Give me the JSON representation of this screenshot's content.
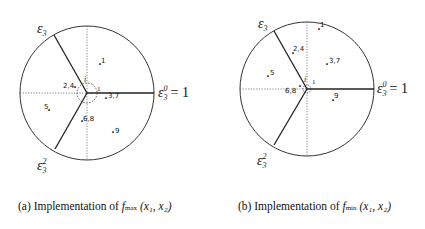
{
  "panels": [
    {
      "id": "a",
      "center": [
        87,
        93
      ],
      "radius": 67,
      "labels": {
        "top_axis": "ε3",
        "right_axis": "ε3^0 = 1",
        "bottom_axis": "ε3^2",
        "origin_i": "i",
        "origin_1": "1"
      },
      "points": [
        {
          "label": "1",
          "x": 100,
          "y": 69
        },
        {
          "label": "2,4",
          "x": 75,
          "y": 92
        },
        {
          "label": "3,7",
          "x": 106,
          "y": 103
        },
        {
          "label": "5",
          "x": 49,
          "y": 115
        },
        {
          "label": "6,8",
          "x": 82,
          "y": 126
        },
        {
          "label": "9",
          "x": 113,
          "y": 137
        }
      ],
      "caption": {
        "prefix": "(a) Implementation of ",
        "func": "f",
        "sub": "max",
        "args": "(x₁, x₂)"
      }
    },
    {
      "id": "b",
      "center": [
        307,
        89
      ],
      "radius": 67,
      "labels": {
        "top_axis": "ε3",
        "right_axis": "ε3^0 = 1",
        "bottom_axis": "ε3^2",
        "origin_i": "i",
        "origin_1": "1"
      },
      "points": [
        {
          "label": "1",
          "x": 319,
          "y": 32
        },
        {
          "label": "2,4",
          "x": 293,
          "y": 56
        },
        {
          "label": "3,7",
          "x": 327,
          "y": 67
        },
        {
          "label": "5",
          "x": 268,
          "y": 79
        },
        {
          "label": "6,8",
          "x": 300,
          "y": 89
        },
        {
          "label": "9",
          "x": 333,
          "y": 103
        }
      ],
      "caption": {
        "prefix": "(b) Implementation of ",
        "func": "f",
        "sub": "min",
        "args": "(x₁, x₂)"
      }
    }
  ]
}
